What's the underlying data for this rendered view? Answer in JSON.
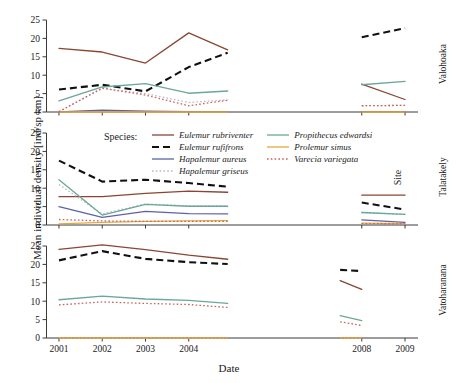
{
  "chart_data": {
    "type": "line",
    "title": "",
    "xlabel": "Date",
    "ylabel": "Mean individual density [ind/sp km]",
    "legend_title": "Species:",
    "legend_position": "inside-middle-panel-top",
    "grid": false,
    "xlim": [
      2000.7,
      2009.3
    ],
    "ylim": [
      0,
      25
    ],
    "yticks": [
      0,
      5,
      10,
      15,
      20,
      25
    ],
    "xticks": [
      2001,
      2002,
      2003,
      2004,
      2008,
      2009
    ],
    "xtick_labels": [
      "2001",
      "2002",
      "2003",
      "2004",
      "2008",
      "2009"
    ],
    "facet_label": "Site",
    "facets": [
      {
        "name": "Valohoaka",
        "series": [
          {
            "name": "Eulemur rubriventer",
            "color": "#8a4632",
            "style": "solid",
            "segments": [
              {
                "x": [
                  2001,
                  2002,
                  2003,
                  2004,
                  2004.9
                ],
                "y": [
                  17.3,
                  16.3,
                  13.3,
                  21.5,
                  16.9
                ]
              },
              {
                "x": [
                  2008,
                  2009
                ],
                "y": [
                  7.6,
                  3.4
                ]
              }
            ]
          },
          {
            "name": "Eulemur rufifrons",
            "color": "#111111",
            "style": "dashed",
            "segments": [
              {
                "x": [
                  2001,
                  2002,
                  2003,
                  2004,
                  2004.9
                ],
                "y": [
                  6.1,
                  7.4,
                  5.6,
                  12.2,
                  16.1
                ]
              },
              {
                "x": [
                  2008,
                  2009
                ],
                "y": [
                  20.3,
                  22.8
                ]
              }
            ]
          },
          {
            "name": "Hapalemur aureus",
            "color": "#5a63a8",
            "style": "solid",
            "segments": [
              {
                "x": [
                  2001,
                  2002,
                  2003,
                  2004,
                  2004.9
                ],
                "y": [
                  0.0,
                  0.5,
                  0.2,
                  0.1,
                  0.1
                ]
              },
              {
                "x": [
                  2008,
                  2009
                ],
                "y": [
                  0.1,
                  0.1
                ]
              }
            ]
          },
          {
            "name": "Hapalemur griseus",
            "color": "#b9b9c4",
            "style": "dotted",
            "segments": [
              {
                "x": [
                  2001,
                  2002,
                  2003,
                  2004,
                  2004.9
                ],
                "y": [
                  0.1,
                  6.4,
                  5.0,
                  2.6,
                  3.3
                ]
              },
              {
                "x": [
                  2008,
                  2009
                ],
                "y": [
                  1.7,
                  1.8
                ]
              }
            ]
          },
          {
            "name": "Propithecus edwardsi",
            "color": "#6aa79a",
            "style": "solid",
            "segments": [
              {
                "x": [
                  2001,
                  2002,
                  2003,
                  2004,
                  2004.9
                ],
                "y": [
                  3.0,
                  6.8,
                  7.7,
                  5.1,
                  5.7
                ]
              },
              {
                "x": [
                  2008,
                  2009
                ],
                "y": [
                  7.4,
                  8.3
                ]
              }
            ]
          },
          {
            "name": "Prolemur simus",
            "color": "#e7a73c",
            "style": "solid",
            "segments": [
              {
                "x": [
                  2001,
                  2002,
                  2003,
                  2004,
                  2004.9
                ],
                "y": [
                  0.0,
                  0.0,
                  0.0,
                  0.0,
                  0.0
                ]
              },
              {
                "x": [
                  2008,
                  2009
                ],
                "y": [
                  0.0,
                  0.0
                ]
              }
            ]
          },
          {
            "name": "Varecia variegata",
            "color": "#c9645c",
            "style": "dotted",
            "segments": [
              {
                "x": [
                  2001,
                  2002,
                  2003,
                  2004,
                  2004.9
                ],
                "y": [
                  0.1,
                  6.5,
                  4.6,
                  1.7,
                  3.2
                ]
              },
              {
                "x": [
                  2008,
                  2009
                ],
                "y": [
                  1.7,
                  1.8
                ]
              }
            ]
          }
        ]
      },
      {
        "name": "Talatakely",
        "series": [
          {
            "name": "Eulemur rubriventer",
            "color": "#8a4632",
            "style": "solid",
            "segments": [
              {
                "x": [
                  2001,
                  2002,
                  2003,
                  2004,
                  2004.9
                ],
                "y": [
                  7.7,
                  7.7,
                  8.6,
                  9.2,
                  8.9
                ]
              },
              {
                "x": [
                  2008,
                  2009
                ],
                "y": [
                  8.1,
                  8.1
                ]
              }
            ]
          },
          {
            "name": "Eulemur rufifrons",
            "color": "#111111",
            "style": "dashed",
            "segments": [
              {
                "x": [
                  2001,
                  2002,
                  2003,
                  2004,
                  2004.9
                ],
                "y": [
                  17.5,
                  11.8,
                  12.3,
                  11.4,
                  10.4
                ]
              },
              {
                "x": [
                  2008,
                  2009
                ],
                "y": [
                  6.1,
                  4.2
                ]
              }
            ]
          },
          {
            "name": "Hapalemur aureus",
            "color": "#5a63a8",
            "style": "solid",
            "segments": [
              {
                "x": [
                  2001,
                  2002,
                  2003,
                  2004,
                  2004.9
                ],
                "y": [
                  5.0,
                  2.1,
                  3.7,
                  3.1,
                  3.0
                ]
              },
              {
                "x": [
                  2008,
                  2009
                ],
                "y": [
                  1.4,
                  0.7
                ]
              }
            ]
          },
          {
            "name": "Hapalemur griseus",
            "color": "#b9b9c4",
            "style": "dotted",
            "segments": [
              {
                "x": [
                  2001,
                  2002,
                  2003,
                  2004,
                  2004.9
                ],
                "y": [
                  11.0,
                  3.0,
                  5.7,
                  5.2,
                  5.2
                ]
              },
              {
                "x": [
                  2008,
                  2009
                ],
                "y": [
                  3.4,
                  2.9
                ]
              }
            ]
          },
          {
            "name": "Propithecus edwardsi",
            "color": "#6aa79a",
            "style": "solid",
            "segments": [
              {
                "x": [
                  2001,
                  2002,
                  2003,
                  2004,
                  2004.9
                ],
                "y": [
                  12.3,
                  2.7,
                  5.6,
                  5.1,
                  5.1
                ]
              },
              {
                "x": [
                  2008,
                  2009
                ],
                "y": [
                  3.4,
                  2.9
                ]
              }
            ]
          },
          {
            "name": "Prolemur simus",
            "color": "#e7a73c",
            "style": "solid",
            "segments": [
              {
                "x": [
                  2001,
                  2002,
                  2003,
                  2004,
                  2004.9
                ],
                "y": [
                  0.3,
                  0.7,
                  1.0,
                  1.1,
                  1.2
                ]
              },
              {
                "x": [
                  2008,
                  2009
                ],
                "y": [
                  0.5,
                  0.4
                ]
              }
            ]
          },
          {
            "name": "Varecia variegata",
            "color": "#c9645c",
            "style": "dotted",
            "segments": [
              {
                "x": [
                  2001,
                  2002,
                  2003,
                  2004,
                  2004.9
                ],
                "y": [
                  1.5,
                  1.1,
                  1.0,
                  1.0,
                  1.0
                ]
              },
              {
                "x": [
                  2008,
                  2009
                ],
                "y": [
                  0.4,
                  0.3
                ]
              }
            ]
          }
        ]
      },
      {
        "name": "Vatoharanana",
        "series": [
          {
            "name": "Eulemur rubriventer",
            "color": "#8a4632",
            "style": "solid",
            "segments": [
              {
                "x": [
                  2001,
                  2002,
                  2003,
                  2004,
                  2004.9
                ],
                "y": [
                  24.1,
                  25.3,
                  24.0,
                  22.5,
                  21.4
                ]
              },
              {
                "x": [
                  2007.5,
                  2008
                ],
                "y": [
                  15.6,
                  13.2
                ]
              }
            ]
          },
          {
            "name": "Eulemur rufifrons",
            "color": "#111111",
            "style": "dashed",
            "segments": [
              {
                "x": [
                  2001,
                  2002,
                  2003,
                  2004,
                  2004.9
                ],
                "y": [
                  21.1,
                  23.6,
                  21.5,
                  20.6,
                  20.1
                ]
              },
              {
                "x": [
                  2007.5,
                  2008
                ],
                "y": [
                  18.5,
                  18.2
                ]
              }
            ]
          },
          {
            "name": "Hapalemur aureus",
            "color": "#5a63a8",
            "style": "solid",
            "segments": [
              {
                "x": [
                  2001,
                  2002,
                  2003,
                  2004,
                  2004.9
                ],
                "y": [
                  0.0,
                  0.0,
                  0.0,
                  0.0,
                  0.0
                ]
              },
              {
                "x": [
                  2007.5,
                  2008
                ],
                "y": [
                  0.0,
                  0.0
                ]
              }
            ]
          },
          {
            "name": "Hapalemur griseus",
            "color": "#b9b9c4",
            "style": "dotted",
            "segments": [
              {
                "x": [
                  2001,
                  2002,
                  2003,
                  2004,
                  2004.9
                ],
                "y": [
                  0.0,
                  0.0,
                  0.0,
                  0.0,
                  0.0
                ]
              },
              {
                "x": [
                  2007.5,
                  2008
                ],
                "y": [
                  0.0,
                  0.0
                ]
              }
            ]
          },
          {
            "name": "Propithecus edwardsi",
            "color": "#6aa79a",
            "style": "solid",
            "segments": [
              {
                "x": [
                  2001,
                  2002,
                  2003,
                  2004,
                  2004.9
                ],
                "y": [
                  10.4,
                  11.4,
                  10.6,
                  10.2,
                  9.4
                ]
              },
              {
                "x": [
                  2007.5,
                  2008
                ],
                "y": [
                  6.1,
                  4.7
                ]
              }
            ]
          },
          {
            "name": "Prolemur simus",
            "color": "#e7a73c",
            "style": "solid",
            "segments": [
              {
                "x": [
                  2001,
                  2002,
                  2003,
                  2004,
                  2004.9
                ],
                "y": [
                  0.0,
                  0.0,
                  0.0,
                  0.0,
                  0.0
                ]
              },
              {
                "x": [
                  2007.5,
                  2008
                ],
                "y": [
                  0.0,
                  0.0
                ]
              }
            ]
          },
          {
            "name": "Varecia variegata",
            "color": "#c9645c",
            "style": "dotted",
            "segments": [
              {
                "x": [
                  2001,
                  2002,
                  2003,
                  2004,
                  2004.9
                ],
                "y": [
                  9.0,
                  9.8,
                  9.4,
                  9.1,
                  8.3
                ]
              },
              {
                "x": [
                  2007.5,
                  2008
                ],
                "y": [
                  4.4,
                  3.4
                ]
              }
            ]
          }
        ]
      }
    ],
    "legend_entries": [
      {
        "name": "Eulemur rubriventer",
        "color": "#8a4632",
        "style": "solid"
      },
      {
        "name": "Propithecus edwardsi",
        "color": "#6aa79a",
        "style": "solid"
      },
      {
        "name": "Eulemur rufifrons",
        "color": "#111111",
        "style": "dashed"
      },
      {
        "name": "Prolemur simus",
        "color": "#e7a73c",
        "style": "solid"
      },
      {
        "name": "Hapalemur aureus",
        "color": "#5a63a8",
        "style": "solid"
      },
      {
        "name": "Varecia variegata",
        "color": "#c9645c",
        "style": "dotted"
      },
      {
        "name": "Hapalemur griseus",
        "color": "#b9b9c4",
        "style": "dotted"
      }
    ]
  }
}
